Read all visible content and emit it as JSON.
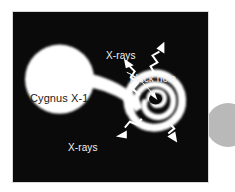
{
  "figure": {
    "background_color": "#ffffff",
    "panel_color": "#0a0a0a",
    "panel_border_color": "#d8d8d8",
    "feature_color": "#ffffff",
    "label_color": "#f2f2f2",
    "star_label_color": "#1a1a1a",
    "edge_circle_color": "#b9b9b9"
  },
  "labels": {
    "star": "Cygnus X-1",
    "xrays_top": "X-rays",
    "xrays_bottom": "X-rays",
    "black_hole": "black hole"
  },
  "objects": {
    "companion_star": "Cygnus X-1",
    "accretion_stream": "accretion-stream",
    "accretion_disk": "accretion-disk-spiral",
    "black_hole": "black hole",
    "xray_emission": "X-rays"
  },
  "annotations": {
    "xray_arrow_count": 4,
    "pointer_lines": 1
  }
}
